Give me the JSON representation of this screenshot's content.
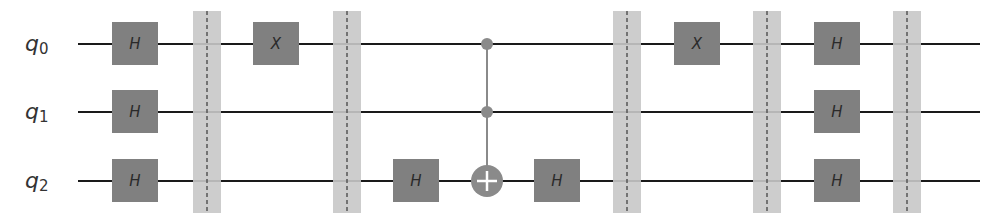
{
  "diagram": {
    "type": "quantum-circuit",
    "colors": {
      "wire": "#1a1a1a",
      "gate_fill": "#808080",
      "gate_text": "#2a2a2a",
      "barrier_fill": "#c8c8c8",
      "barrier_line": "#555555",
      "control": "#8a8a8a",
      "target_fill": "#8a8a8a",
      "target_plus": "#ffffff",
      "label": "#333333"
    },
    "qubits": [
      {
        "label": "q",
        "sub": "0",
        "y": 44
      },
      {
        "label": "q",
        "sub": "1",
        "y": 112
      },
      {
        "label": "q",
        "sub": "2",
        "y": 181
      }
    ],
    "wire_start_x": 78,
    "wire_end_x": 980,
    "barriers": [
      {
        "x": 207
      },
      {
        "x": 347
      },
      {
        "x": 627
      },
      {
        "x": 767
      },
      {
        "x": 907
      }
    ],
    "gates": [
      {
        "name": "H",
        "qubit": 0,
        "x": 135
      },
      {
        "name": "H",
        "qubit": 1,
        "x": 135
      },
      {
        "name": "H",
        "qubit": 2,
        "x": 135
      },
      {
        "name": "X",
        "qubit": 0,
        "x": 276
      },
      {
        "name": "H",
        "qubit": 2,
        "x": 416
      },
      {
        "name": "H",
        "qubit": 2,
        "x": 557
      },
      {
        "name": "X",
        "qubit": 0,
        "x": 697
      },
      {
        "name": "H",
        "qubit": 0,
        "x": 837
      },
      {
        "name": "H",
        "qubit": 1,
        "x": 837
      },
      {
        "name": "H",
        "qubit": 2,
        "x": 837
      }
    ],
    "multi_gates": [
      {
        "name": "CCX",
        "controls": [
          0,
          1
        ],
        "target": 2,
        "x": 487
      }
    ]
  }
}
